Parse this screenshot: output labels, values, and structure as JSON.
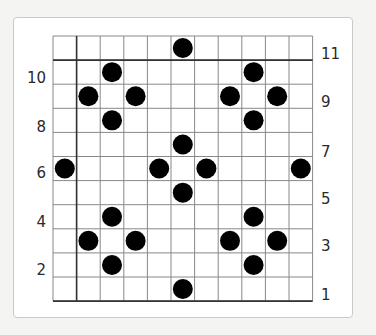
{
  "diagram": {
    "type": "dot-grid-pattern",
    "grid": {
      "columns": 11,
      "rows": 11,
      "left": 53,
      "top": 36,
      "cell_width": 23.6,
      "cell_height": 24.1,
      "line_color": "#888888",
      "thick_line_color": "#333333",
      "thick_lines": {
        "vertical_x_index": 1,
        "horizontal_y_index": 1,
        "bottom": true
      }
    },
    "dot_color": "#000000",
    "dot_radius": 10,
    "dots": [
      {
        "col": 5,
        "row": 0
      },
      {
        "col": 2,
        "row": 1
      },
      {
        "col": 8,
        "row": 1
      },
      {
        "col": 1,
        "row": 2
      },
      {
        "col": 3,
        "row": 2
      },
      {
        "col": 7,
        "row": 2
      },
      {
        "col": 9,
        "row": 2
      },
      {
        "col": 2,
        "row": 3
      },
      {
        "col": 8,
        "row": 3
      },
      {
        "col": 5,
        "row": 4
      },
      {
        "col": 0,
        "row": 5
      },
      {
        "col": 4,
        "row": 5
      },
      {
        "col": 6,
        "row": 5
      },
      {
        "col": 10,
        "row": 5
      },
      {
        "col": 5,
        "row": 6
      },
      {
        "col": 2,
        "row": 7
      },
      {
        "col": 8,
        "row": 7
      },
      {
        "col": 1,
        "row": 8
      },
      {
        "col": 3,
        "row": 8
      },
      {
        "col": 7,
        "row": 8
      },
      {
        "col": 9,
        "row": 8
      },
      {
        "col": 2,
        "row": 9
      },
      {
        "col": 8,
        "row": 9
      },
      {
        "col": 5,
        "row": 10
      }
    ],
    "left_labels": [
      {
        "text": "10",
        "y": 78
      },
      {
        "text": "8",
        "y": 127
      },
      {
        "text": "6",
        "y": 173
      },
      {
        "text": "4",
        "y": 222
      },
      {
        "text": "2",
        "y": 270
      }
    ],
    "right_labels": [
      {
        "text": "11",
        "y": 54
      },
      {
        "text": "9",
        "y": 102
      },
      {
        "text": "7",
        "y": 152
      },
      {
        "text": "5",
        "y": 199
      },
      {
        "text": "3",
        "y": 246
      },
      {
        "text": "1",
        "y": 295
      }
    ]
  }
}
